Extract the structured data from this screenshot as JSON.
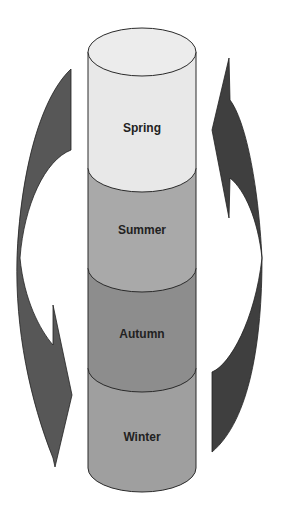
{
  "diagram": {
    "type": "cycle-cylinder",
    "segments": [
      {
        "label": "Spring",
        "color": "#e8e8e8"
      },
      {
        "label": "Summer",
        "color": "#a9a9a9"
      },
      {
        "label": "Autumn",
        "color": "#8d8d8d"
      },
      {
        "label": "Winter",
        "color": "#9f9f9f"
      }
    ],
    "arrows": [
      {
        "side": "left",
        "direction": "down",
        "color": "#575757"
      },
      {
        "side": "right",
        "direction": "up",
        "color": "#3f3f3f"
      }
    ],
    "stroke_color": "#2a2a2a"
  }
}
